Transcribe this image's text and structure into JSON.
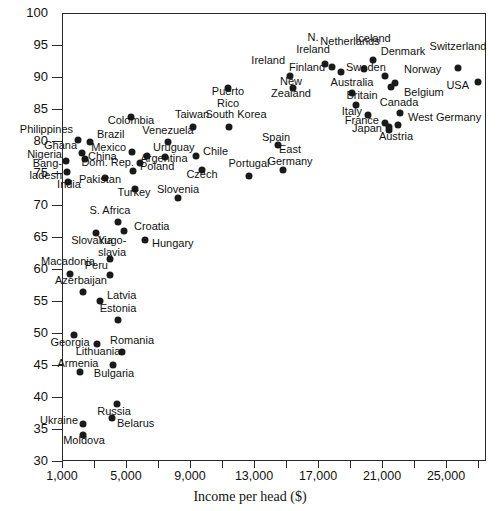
{
  "chart_data": {
    "type": "scatter",
    "title": "",
    "xlabel": "Income per head ($)",
    "ylabel": "",
    "xlim": [
      0,
      27500
    ],
    "ylim": [
      30,
      100
    ],
    "grid": false,
    "legend": "none",
    "x_ticks": [
      "1,000",
      "5,000",
      "9,000",
      "13,000",
      "17,000",
      "21,000",
      "25,000"
    ],
    "x_tick_values": [
      1000,
      5000,
      9000,
      13000,
      17000,
      21000,
      25000
    ],
    "x_minor_tick_values": [
      3000,
      7000,
      11000,
      15000,
      19000,
      23000,
      27000
    ],
    "y_ticks": [
      "100",
      "95",
      "90",
      "85",
      "80",
      "75",
      "70",
      "65",
      "60",
      "55",
      "50",
      "45",
      "40",
      "35",
      "30"
    ],
    "y_tick_values": [
      100,
      95,
      90,
      85,
      80,
      75,
      70,
      65,
      60,
      55,
      50,
      45,
      40,
      35,
      30
    ],
    "points": [
      {
        "name": "Iceland",
        "x": 19500,
        "y": 92.3,
        "px": 373,
        "py": 60,
        "lx": 373,
        "ly": 39,
        "align": "c"
      },
      {
        "name": "Switzerland",
        "x": 24900,
        "y": 91.4,
        "px": 458,
        "py": 68,
        "lx": 458,
        "ly": 47,
        "align": "c"
      },
      {
        "name": "N.\nIreland",
        "x": 16300,
        "y": 92.6,
        "px": 325,
        "py": 64,
        "lx": 313,
        "ly": 38,
        "align": "c"
      },
      {
        "name": "Netherlands",
        "x": 18700,
        "y": 92.0,
        "px": 364,
        "py": 69,
        "lx": 350,
        "ly": 42,
        "align": "c"
      },
      {
        "name": "Denmark",
        "x": 20000,
        "y": 90.8,
        "px": 385,
        "py": 76,
        "lx": 403,
        "ly": 52,
        "align": "c"
      },
      {
        "name": "Finland",
        "x": 16700,
        "y": 92.0,
        "px": 332,
        "py": 67,
        "lx": 325,
        "ly": 68,
        "align": "r"
      },
      {
        "name": "Sweden",
        "x": 17300,
        "y": 91.3,
        "px": 341,
        "py": 72,
        "lx": 346,
        "ly": 68,
        "align": "l"
      },
      {
        "name": "Norway",
        "x": 20700,
        "y": 89.3,
        "px": 395,
        "py": 83,
        "lx": 404,
        "ly": 70,
        "align": "l"
      },
      {
        "name": "Ireland",
        "x": 14000,
        "y": 91.2,
        "px": 290,
        "py": 76,
        "lx": 285,
        "ly": 61,
        "align": "r"
      },
      {
        "name": "New\nZealand",
        "x": 14100,
        "y": 89.6,
        "px": 293,
        "py": 88,
        "lx": 291,
        "ly": 82,
        "align": "c"
      },
      {
        "name": "Australia",
        "x": 17900,
        "y": 88.5,
        "px": 352,
        "py": 93,
        "lx": 352,
        "ly": 83,
        "align": "c"
      },
      {
        "name": "Belgium",
        "x": 20400,
        "y": 88.1,
        "px": 391,
        "py": 87,
        "lx": 404,
        "ly": 93,
        "align": "l"
      },
      {
        "name": "Britain",
        "x": 18000,
        "y": 85.7,
        "px": 356,
        "py": 105,
        "lx": 362,
        "ly": 96,
        "align": "c"
      },
      {
        "name": "Canada",
        "x": 21200,
        "y": 85.2,
        "px": 400,
        "py": 113,
        "lx": 399,
        "ly": 103,
        "align": "c"
      },
      {
        "name": "Italy",
        "x": 18600,
        "y": 85.0,
        "px": 368,
        "py": 115,
        "lx": 362,
        "ly": 112,
        "align": "r"
      },
      {
        "name": "West Germany",
        "x": 21000,
        "y": 83.7,
        "px": 398,
        "py": 125,
        "lx": 408,
        "ly": 118,
        "align": "l"
      },
      {
        "name": "France",
        "x": 19500,
        "y": 83.6,
        "px": 385,
        "py": 123,
        "lx": 379,
        "ly": 121,
        "align": "r"
      },
      {
        "name": "Japan",
        "x": 19800,
        "y": 83.2,
        "px": 389,
        "py": 127,
        "lx": 382,
        "ly": 129,
        "align": "r"
      },
      {
        "name": "Austria",
        "x": 19800,
        "y": 82.3,
        "px": 389,
        "py": 130,
        "lx": 396,
        "ly": 137,
        "align": "c"
      },
      {
        "name": "USA",
        "x": 26000,
        "y": 88.9,
        "px": 478,
        "py": 82,
        "lx": 469,
        "ly": 86,
        "align": "r"
      },
      {
        "name": "Puerto\nRico",
        "x": 11600,
        "y": 88.0,
        "px": 228,
        "py": 88,
        "lx": 228,
        "ly": 92,
        "align": "c"
      },
      {
        "name": "Taiwan",
        "x": 9200,
        "y": 82.2,
        "px": 193,
        "py": 127,
        "lx": 192,
        "ly": 115,
        "align": "c"
      },
      {
        "name": "South Korea",
        "x": 11700,
        "y": 82.2,
        "px": 229,
        "py": 127,
        "lx": 236,
        "ly": 115,
        "align": "c"
      },
      {
        "name": "Colombia",
        "x": 5400,
        "y": 83.7,
        "px": 131,
        "py": 117,
        "lx": 131,
        "ly": 121,
        "align": "c"
      },
      {
        "name": "Venezuela",
        "x": 7700,
        "y": 79.5,
        "px": 168,
        "py": 142,
        "lx": 168,
        "ly": 131,
        "align": "c"
      },
      {
        "name": "Philippines",
        "x": 2500,
        "y": 79.8,
        "px": 78,
        "py": 140,
        "lx": 73,
        "ly": 130,
        "align": "r"
      },
      {
        "name": "Brazil",
        "x": 3300,
        "y": 79.3,
        "px": 90,
        "py": 142,
        "lx": 97,
        "ly": 135,
        "align": "l"
      },
      {
        "name": "Spain",
        "x": 14800,
        "y": 78.0,
        "px": 278,
        "py": 145,
        "lx": 276,
        "ly": 138,
        "align": "c"
      },
      {
        "name": "Mexico",
        "x": 5500,
        "y": 77.6,
        "px": 132,
        "py": 152,
        "lx": 126,
        "ly": 148,
        "align": "r"
      },
      {
        "name": "Uruguay",
        "x": 6400,
        "y": 77.2,
        "px": 147,
        "py": 156,
        "lx": 153,
        "ly": 148,
        "align": "l"
      },
      {
        "name": "Ghana",
        "x": 2700,
        "y": 77.3,
        "px": 82,
        "py": 153,
        "lx": 77,
        "ly": 146,
        "align": "r"
      },
      {
        "name": "Argentina",
        "x": 7600,
        "y": 77.1,
        "px": 165,
        "py": 157,
        "lx": 164,
        "ly": 159,
        "align": "c"
      },
      {
        "name": "Chile",
        "x": 9500,
        "y": 77.2,
        "px": 196,
        "py": 156,
        "lx": 203,
        "ly": 152,
        "align": "l"
      },
      {
        "name": "Nigeria",
        "x": 1800,
        "y": 75.8,
        "px": 66,
        "py": 161,
        "lx": 62,
        "ly": 155,
        "align": "r"
      },
      {
        "name": "China",
        "x": 3000,
        "y": 77.8,
        "px": 85,
        "py": 159,
        "lx": 88,
        "ly": 157,
        "align": "l"
      },
      {
        "name": "East\nGermany",
        "x": 15400,
        "y": 76.4,
        "px": 283,
        "py": 170,
        "lx": 290,
        "ly": 150,
        "align": "c"
      },
      {
        "name": "Portugal",
        "x": 13000,
        "y": 74.8,
        "px": 249,
        "py": 176,
        "lx": 249,
        "ly": 164,
        "align": "c"
      },
      {
        "name": "Dom. Rep.",
        "x": 5900,
        "y": 76.7,
        "px": 140,
        "py": 163,
        "lx": 134,
        "ly": 163,
        "align": "r"
      },
      {
        "name": "Bang-\nladesh",
        "x": 1900,
        "y": 74.0,
        "px": 67,
        "py": 172,
        "lx": 62,
        "ly": 164,
        "align": "r"
      },
      {
        "name": "Czech",
        "x": 10200,
        "y": 74.9,
        "px": 202,
        "py": 170,
        "lx": 202,
        "ly": 175,
        "align": "c"
      },
      {
        "name": "Poland",
        "x": 5500,
        "y": 74.4,
        "px": 133,
        "py": 171,
        "lx": 140,
        "ly": 167,
        "align": "l"
      },
      {
        "name": "Pakistan",
        "x": 3800,
        "y": 74.4,
        "px": 105,
        "py": 178,
        "lx": 100,
        "ly": 180,
        "align": "c"
      },
      {
        "name": "India",
        "x": 1900,
        "y": 72.0,
        "px": 68,
        "py": 182,
        "lx": 69,
        "ly": 185,
        "align": "c"
      },
      {
        "name": "Turkey",
        "x": 5600,
        "y": 72.1,
        "px": 135,
        "py": 189,
        "lx": 134,
        "ly": 193,
        "align": "c"
      },
      {
        "name": "Slovenia",
        "x": 8600,
        "y": 69.3,
        "px": 178,
        "py": 198,
        "lx": 178,
        "ly": 190,
        "align": "c"
      },
      {
        "name": "S. Africa",
        "x": 4400,
        "y": 67.4,
        "px": 118,
        "py": 222,
        "lx": 110,
        "ly": 211,
        "align": "c"
      },
      {
        "name": "Croatia",
        "x": 4800,
        "y": 64.9,
        "px": 124,
        "py": 231,
        "lx": 134,
        "ly": 227,
        "align": "l"
      },
      {
        "name": "Slovakia",
        "x": 3300,
        "y": 65.8,
        "px": 96,
        "py": 233,
        "lx": 92,
        "ly": 241,
        "align": "c"
      },
      {
        "name": "Hungary",
        "x": 6300,
        "y": 64.6,
        "px": 145,
        "py": 240,
        "lx": 152,
        "ly": 244,
        "align": "l"
      },
      {
        "name": "Yugo-\nslavia",
        "x": 3900,
        "y": 61.8,
        "px": 110,
        "py": 259,
        "lx": 112,
        "ly": 241,
        "align": "c"
      },
      {
        "name": "Peru",
        "x": 3900,
        "y": 59.5,
        "px": 110,
        "py": 275,
        "lx": 108,
        "ly": 266,
        "align": "r"
      },
      {
        "name": "Macadonia",
        "x": 1800,
        "y": 59.5,
        "px": 70,
        "py": 274,
        "lx": 68,
        "ly": 262,
        "align": "c"
      },
      {
        "name": "Azerbaijan",
        "x": 2600,
        "y": 55.9,
        "px": 83,
        "py": 292,
        "lx": 81,
        "ly": 281,
        "align": "c"
      },
      {
        "name": "Latvia",
        "x": 3200,
        "y": 55.3,
        "px": 100,
        "py": 301,
        "lx": 107,
        "ly": 296,
        "align": "l"
      },
      {
        "name": "Estonia",
        "x": 4500,
        "y": 50.8,
        "px": 118,
        "py": 320,
        "lx": 118,
        "ly": 309,
        "align": "c"
      },
      {
        "name": "Georgia",
        "x": 2000,
        "y": 50.0,
        "px": 74,
        "py": 335,
        "lx": 70,
        "ly": 343,
        "align": "c"
      },
      {
        "name": "Romania",
        "x": 4800,
        "y": 47.9,
        "px": 122,
        "py": 352,
        "lx": 132,
        "ly": 341,
        "align": "c"
      },
      {
        "name": "Lithuania",
        "x": 3000,
        "y": 48.5,
        "px": 97,
        "py": 344,
        "lx": 98,
        "ly": 352,
        "align": "c"
      },
      {
        "name": "Bulgaria",
        "x": 4200,
        "y": 44.9,
        "px": 113,
        "py": 365,
        "lx": 114,
        "ly": 374,
        "align": "c"
      },
      {
        "name": "Armenia",
        "x": 2300,
        "y": 43.0,
        "px": 80,
        "py": 372,
        "lx": 78,
        "ly": 364,
        "align": "c"
      },
      {
        "name": "Russia",
        "x": 4400,
        "y": 39.3,
        "px": 117,
        "py": 404,
        "lx": 114,
        "ly": 412,
        "align": "c"
      },
      {
        "name": "Belarus",
        "x": 4200,
        "y": 35.0,
        "px": 112,
        "py": 418,
        "lx": 117,
        "ly": 424,
        "align": "l"
      },
      {
        "name": "Ukraine",
        "x": 2400,
        "y": 34.0,
        "px": 83,
        "py": 424,
        "lx": 78,
        "ly": 421,
        "align": "r"
      },
      {
        "name": "Moldova",
        "x": 2400,
        "y": 32.4,
        "px": 83,
        "py": 435,
        "lx": 84,
        "ly": 441,
        "align": "c"
      }
    ]
  },
  "axis": {
    "x_title": "Income per head ($)"
  }
}
